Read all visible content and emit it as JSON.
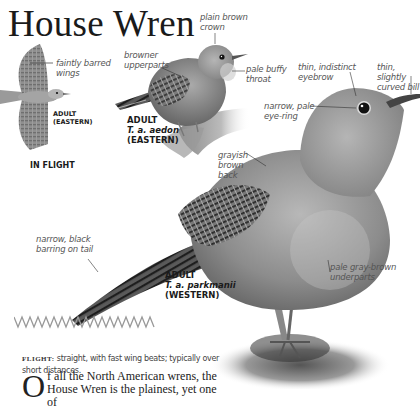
{
  "page": {
    "title": "House Wren"
  },
  "illustrations": {
    "flight": {
      "caption_line1": "ADULT",
      "caption_line2": "(EASTERN)",
      "heading": "IN FLIGHT",
      "annotations": [
        "faintly barred wings"
      ]
    },
    "eastern": {
      "caption_line1": "ADULT",
      "scientific": "T. a. aedon",
      "caption_line3": "(EASTERN)",
      "annotations": {
        "crown": "plain brown crown",
        "upperparts": "browner upperparts",
        "throat": "pale buffy throat"
      }
    },
    "western": {
      "caption_line1": "ADULT",
      "scientific": "T. a. parkmanii",
      "caption_line3": "(WESTERN)",
      "annotations": {
        "eyebrow": "thin, indistinct eyebrow",
        "bill": "thin, slightly curved bill",
        "eyering": "narrow, pale eye-ring",
        "back": "grayish brown back",
        "tail": "narrow, black barring on tail",
        "underparts": "pale gray-brown underparts"
      }
    }
  },
  "labels": {
    "faintly_l1": "faintly barred",
    "faintly_l2": "wings",
    "crown_l1": "plain brown",
    "crown_l2": "crown",
    "upper_l1": "browner",
    "upper_l2": "upperparts",
    "throat_l1": "pale buffy",
    "throat_l2": "throat",
    "eyebrow_l1": "thin, indistinct",
    "eyebrow_l2": "eyebrow",
    "bill_l1": "thin, slightly",
    "bill_l2": "curved bill",
    "eyering_l1": "narrow, pale",
    "eyering_l2": "eye-ring",
    "back_l1": "grayish",
    "back_l2": "brown",
    "back_l3": "back",
    "tail_l1": "narrow, black",
    "tail_l2": "barring on tail",
    "under_l1": "pale gray-brown",
    "under_l2": "underparts"
  },
  "flight_section": {
    "label": "FLIGHT:",
    "text": " straight, with fast wing beats; typically over short distances."
  },
  "body": {
    "dropcap": "O",
    "text": "f all the North American wrens, the House Wren is the plainest, yet one of"
  }
}
